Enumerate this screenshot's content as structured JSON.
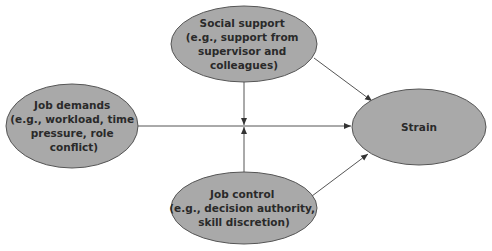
{
  "diagram": {
    "type": "path-model",
    "colors": {
      "node_fill": "#a9a9a9",
      "node_stroke": "#555555",
      "edge": "#555555",
      "text": "#2a2a2a",
      "background": "#ffffff"
    },
    "nodes": [
      {
        "id": "social_support",
        "lines": [
          "Social support",
          "(e.g., support from",
          "supervisor and",
          "colleagues)"
        ],
        "cx": 244,
        "cy": 44,
        "rx": 73,
        "ry": 38
      },
      {
        "id": "job_demands",
        "lines": [
          "Job demands",
          "(e.g., workload, time",
          "pressure, role",
          "conflict)"
        ],
        "cx": 72,
        "cy": 126,
        "rx": 66,
        "ry": 42
      },
      {
        "id": "job_control",
        "lines": [
          "Job control",
          "(e.g., decision authority,",
          "skill discretion)"
        ],
        "cx": 244,
        "cy": 208,
        "rx": 73,
        "ry": 36
      },
      {
        "id": "strain",
        "lines": [
          "Strain"
        ],
        "cx": 419,
        "cy": 127,
        "rx": 67,
        "ry": 38
      }
    ],
    "edges": [
      {
        "from": "job_demands",
        "to": "strain",
        "label": "main effect"
      },
      {
        "from": "social_support",
        "to": "strain",
        "label": "main effect"
      },
      {
        "from": "job_control",
        "to": "strain",
        "label": "main effect"
      },
      {
        "from": "social_support",
        "to": "job_demands->strain",
        "label": "moderation"
      },
      {
        "from": "job_control",
        "to": "job_demands->strain",
        "label": "moderation"
      }
    ]
  }
}
